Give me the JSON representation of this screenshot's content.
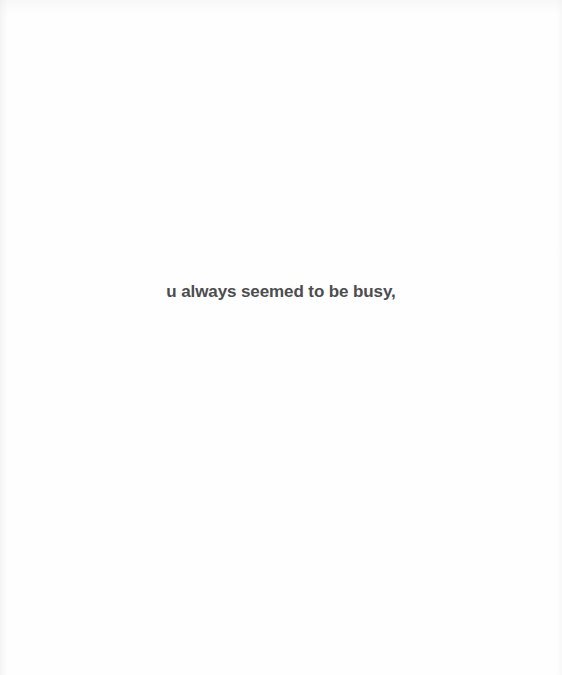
{
  "slide": {
    "caption": "u always seemed to be busy,",
    "background_color": "#fefefe",
    "text_color": "#4d4d4f"
  }
}
